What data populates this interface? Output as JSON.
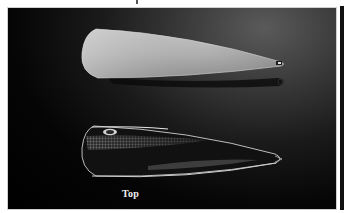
{
  "figure": {
    "caption_label": "Top",
    "colors": {
      "background": "#000000",
      "lure_back_face": "#b8b8b8",
      "lure_top_face": "#1a1a1a",
      "scale_pattern": "#9a9a9a",
      "frame_border": "#cfcfcf",
      "caption_text": "#f0f0f0"
    },
    "icons": {
      "upper_lure": "spoon-lure-back-icon",
      "lower_lure": "spoon-lure-top-icon"
    }
  }
}
